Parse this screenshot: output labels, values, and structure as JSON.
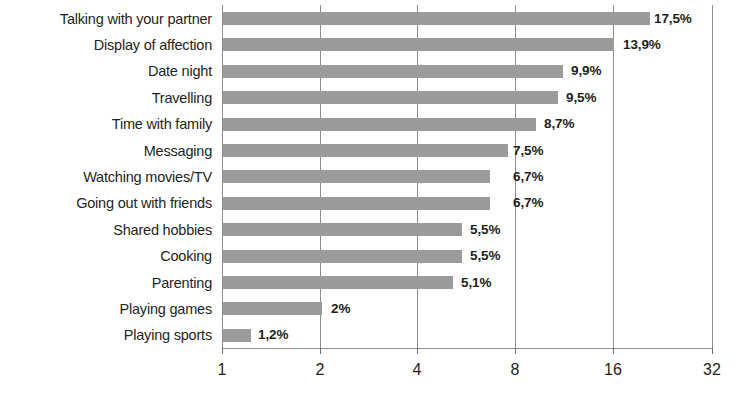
{
  "chart_data": {
    "type": "bar",
    "orientation": "horizontal",
    "title": "",
    "subtitle": "",
    "xlabel": "",
    "ylabel": "",
    "xscale": "log2",
    "xlim": [
      1,
      32
    ],
    "xticks": [
      1,
      2,
      4,
      8,
      16,
      32
    ],
    "xtick_labels": [
      "1",
      "2",
      "4",
      "8",
      "16",
      "32"
    ],
    "grid": true,
    "grid_axis": "x",
    "legend": false,
    "bar_color": "#9b9b9b",
    "text_color": "#231f20",
    "axis_color": "#8e8e8e",
    "categories": [
      "Talking with your partner",
      "Display of affection",
      "Date night",
      "Travelling",
      "Time with family",
      "Messaging",
      "Watching movies/TV",
      "Going out with friends",
      "Shared hobbies",
      "Cooking",
      "Parenting",
      "Playing games",
      "Playing sports"
    ],
    "values": [
      17.5,
      13.9,
      9.9,
      9.5,
      8.7,
      7.5,
      6.7,
      6.7,
      5.5,
      5.5,
      5.1,
      2.0,
      1.2
    ],
    "data_labels": [
      "17,5%",
      "13,9%",
      "9,9%",
      "9,5%",
      "8,7%",
      "7,5%",
      "6,7%",
      "6,7%",
      "5,5%",
      "5,5%",
      "5,1%",
      "2%",
      "1,2%"
    ]
  },
  "rows": [
    {
      "label": "Talking with your partner",
      "value": 17.5,
      "data_label": "17,5%",
      "bar_end_px": 649,
      "label_x_px": 654
    },
    {
      "label": "Display of affection",
      "value": 13.9,
      "data_label": "13,9%",
      "bar_end_px": 613,
      "label_x_px": 623
    },
    {
      "label": "Date night",
      "value": 9.9,
      "data_label": "9,9%",
      "bar_end_px": 562,
      "label_x_px": 571
    },
    {
      "label": "Travelling",
      "value": 9.5,
      "data_label": "9,5%",
      "bar_end_px": 557,
      "label_x_px": 566
    },
    {
      "label": "Time with family",
      "value": 8.7,
      "data_label": "8,7%",
      "bar_end_px": 535,
      "label_x_px": 544
    },
    {
      "label": "Messaging",
      "value": 7.5,
      "data_label": "7,5%",
      "bar_end_px": 507,
      "label_x_px": 513
    },
    {
      "label": "Watching movies/TV",
      "value": 6.7,
      "data_label": "6,7%",
      "bar_end_px": 489,
      "label_x_px": 513
    },
    {
      "label": "Going out with friends",
      "value": 6.7,
      "data_label": "6,7%",
      "bar_end_px": 489,
      "label_x_px": 513
    },
    {
      "label": "Shared hobbies",
      "value": 5.5,
      "data_label": "5,5%",
      "bar_end_px": 461,
      "label_x_px": 470
    },
    {
      "label": "Cooking",
      "value": 5.5,
      "data_label": "5,5%",
      "bar_end_px": 461,
      "label_x_px": 470
    },
    {
      "label": "Parenting",
      "value": 5.1,
      "data_label": "5,1%",
      "bar_end_px": 452,
      "label_x_px": 461
    },
    {
      "label": "Playing games",
      "value": 2.0,
      "data_label": "2%",
      "bar_end_px": 321,
      "label_x_px": 331
    },
    {
      "label": "Playing sports",
      "value": 1.2,
      "data_label": "1,2%",
      "bar_end_px": 250,
      "label_x_px": 258
    }
  ],
  "x_axis": {
    "ticks": [
      {
        "label": "1",
        "x_px": 222
      },
      {
        "label": "2",
        "x_px": 320
      },
      {
        "label": "4",
        "x_px": 417
      },
      {
        "label": "8",
        "x_px": 515
      },
      {
        "label": "16",
        "x_px": 613
      },
      {
        "label": "32",
        "x_px": 712
      }
    ]
  }
}
